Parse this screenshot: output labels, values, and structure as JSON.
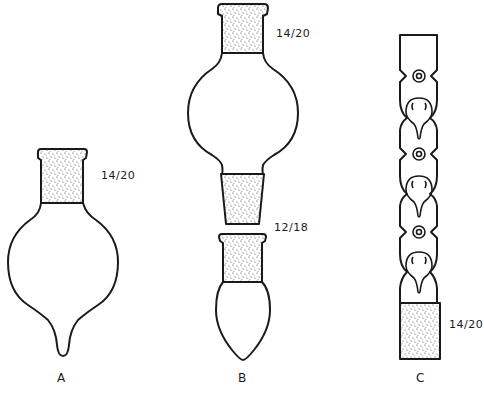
{
  "figure": {
    "panels": [
      {
        "id": "A",
        "caption": "A",
        "joint_label": "14/20",
        "description": "pear-shaped flask with 14/20 ground joint"
      },
      {
        "id": "B",
        "caption": "B",
        "joint_label_top": "14/20",
        "joint_label_bottom": "12/18",
        "description": "bulb with 14/20 joint and 12/18 inner joint, separate pointed receiver"
      },
      {
        "id": "C",
        "caption": "C",
        "joint_label": "14/20",
        "description": "indented column with 14/20 ground joint"
      }
    ],
    "colors": {
      "ink": "#1a1a1a",
      "background": "#ffffff"
    }
  }
}
